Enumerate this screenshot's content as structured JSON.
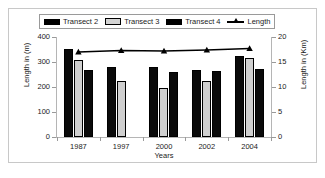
{
  "chart_data": {
    "type": "bar",
    "title": "",
    "subtitle": "",
    "xlabel": "Years",
    "ylabel": "Length in (m)",
    "ylabel_secondary": "Length in (Km)",
    "categories": [
      "1987",
      "1997",
      "2000",
      "2002",
      "2004"
    ],
    "ylim": [
      0,
      400
    ],
    "yticks": [
      0,
      100,
      200,
      300,
      400
    ],
    "ylim_secondary": [
      0,
      20
    ],
    "yticks_secondary": [
      0,
      5,
      10,
      15,
      20
    ],
    "grid": false,
    "legend_position": "top",
    "series": [
      {
        "name": "Transect 2",
        "type": "bar",
        "axis": "left",
        "color": "#000000",
        "values": [
          352,
          282,
          281,
          270,
          325
        ]
      },
      {
        "name": "Transect 3",
        "type": "bar",
        "axis": "left",
        "color": "#cfcfcf",
        "values": [
          308,
          223,
          195,
          223,
          318
        ]
      },
      {
        "name": "Transect 4",
        "type": "bar",
        "axis": "left",
        "color": "#000000",
        "values": [
          268,
          null,
          259,
          264,
          271
        ]
      },
      {
        "name": "Length",
        "type": "line",
        "axis": "right",
        "color": "#000000",
        "marker": "triangle",
        "values": [
          17.0,
          17.3,
          17.2,
          17.4,
          17.7
        ]
      }
    ]
  },
  "legend": {
    "entries": [
      {
        "label": "Transect 2",
        "swatch": "dark-bar-swatch"
      },
      {
        "label": "Transect 3",
        "swatch": "light-bar-swatch"
      },
      {
        "label": "Transect 4",
        "swatch": "dark-bar-swatch"
      },
      {
        "label": "Length",
        "swatch": "line-triangle-marker"
      }
    ]
  },
  "axes": {
    "left_ticks": [
      "400",
      "300",
      "200",
      "100",
      "0"
    ],
    "right_ticks": [
      "20",
      "15",
      "10",
      "5",
      "0"
    ],
    "left_title": "Length in (m)",
    "right_title": "Length in (Km)",
    "x_title": "Years",
    "x_ticks": [
      "1987",
      "1997",
      "2000",
      "2002",
      "2004"
    ]
  },
  "colors": {
    "bar_dark": "#000000",
    "bar_light": "#cfcfcf",
    "line": "#000000",
    "axis": "#b5b5b5",
    "frame": "#c8c8c8",
    "text": "#1a1a1a",
    "background": "#ffffff"
  }
}
